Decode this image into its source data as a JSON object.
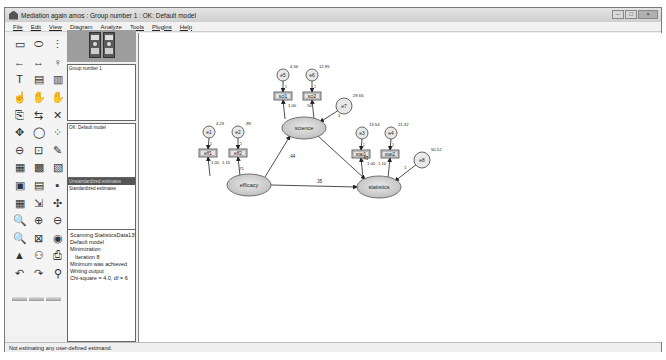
{
  "window": {
    "title": "Mediation again amos : Group number 1 : OK: Default model",
    "controls": {
      "minimize": "–",
      "maximize": "□",
      "close": "×"
    }
  },
  "menu": [
    "File",
    "Edit",
    "View",
    "Diagram",
    "Analyze",
    "Tools",
    "Plugins",
    "Help"
  ],
  "toolbox": {
    "tools": [
      {
        "name": "draw-observed-variable-icon",
        "glyph": "▭"
      },
      {
        "name": "draw-unobserved-variable-icon",
        "glyph": "⬭"
      },
      {
        "name": "draw-indicator-icon",
        "glyph": "⋮"
      },
      {
        "name": "draw-path-icon",
        "glyph": "←"
      },
      {
        "name": "draw-covariance-icon",
        "glyph": "↔"
      },
      {
        "name": "add-unique-variable-icon",
        "glyph": "♀"
      },
      {
        "name": "figure-caption-icon",
        "glyph": "T"
      },
      {
        "name": "list-variables-model-icon",
        "glyph": "▤"
      },
      {
        "name": "list-variables-dataset-icon",
        "glyph": "▥"
      },
      {
        "name": "select-one-icon",
        "glyph": "☝"
      },
      {
        "name": "select-all-icon",
        "glyph": "✋"
      },
      {
        "name": "deselect-all-icon",
        "glyph": "✋"
      },
      {
        "name": "copy-object-icon",
        "glyph": "⎘"
      },
      {
        "name": "move-object-icon",
        "glyph": "⇆"
      },
      {
        "name": "erase-object-icon",
        "glyph": "✕"
      },
      {
        "name": "change-shape-icon",
        "glyph": "✥"
      },
      {
        "name": "rotate-indicators-icon",
        "glyph": "◯"
      },
      {
        "name": "reflect-indicators-icon",
        "glyph": "⁘"
      },
      {
        "name": "move-parameter-icon",
        "glyph": "⊖"
      },
      {
        "name": "scroll-diagram-icon",
        "glyph": "⊡"
      },
      {
        "name": "touch-up-icon",
        "glyph": "✎"
      },
      {
        "name": "data-files-icon",
        "glyph": "▦"
      },
      {
        "name": "analysis-properties-icon",
        "glyph": "▩"
      },
      {
        "name": "calculate-estimates-icon",
        "glyph": "▧"
      },
      {
        "name": "copy-to-clipboard-icon",
        "glyph": "▣"
      },
      {
        "name": "view-text-icon",
        "glyph": "▤"
      },
      {
        "name": "save-diagram-icon",
        "glyph": "▪"
      },
      {
        "name": "object-properties-icon",
        "glyph": "▦"
      },
      {
        "name": "drag-properties-icon",
        "glyph": "⇲"
      },
      {
        "name": "preserve-symmetries-icon",
        "glyph": "✣"
      },
      {
        "name": "zoom-in-area-icon",
        "glyph": "🔍"
      },
      {
        "name": "zoom-in-icon",
        "glyph": "⊕"
      },
      {
        "name": "zoom-out-icon",
        "glyph": "⊖"
      },
      {
        "name": "zoom-page-icon",
        "glyph": "🔍"
      },
      {
        "name": "fit-to-page-icon",
        "glyph": "⊠"
      },
      {
        "name": "loupe-icon",
        "glyph": "◉"
      },
      {
        "name": "bayesian-icon",
        "glyph": "▲"
      },
      {
        "name": "multiple-group-icon",
        "glyph": "⚇"
      },
      {
        "name": "print-icon",
        "glyph": "⎙"
      },
      {
        "name": "undo-icon",
        "glyph": "↶"
      },
      {
        "name": "redo-icon",
        "glyph": "↷"
      },
      {
        "name": "specification-search-icon",
        "glyph": "⚲"
      }
    ]
  },
  "panels": {
    "groups": {
      "header": "Group number 1"
    },
    "models": {
      "header": "OK: Default model"
    },
    "estimates": {
      "items": [
        "Unstandardized estimates",
        "Standardized estimates"
      ],
      "selected": 0
    },
    "log": {
      "lines": [
        {
          "text": "Scanning StatisticsData139'",
          "indent": false
        },
        {
          "text": "Default model",
          "indent": false
        },
        {
          "text": "Minimization",
          "indent": false
        },
        {
          "text": "Iteration 8",
          "indent": true
        },
        {
          "text": "Minimum was achieved",
          "indent": false
        },
        {
          "text": "Writing output",
          "indent": false
        },
        {
          "text": "Chi-square = 4.0, df = 6",
          "indent": false
        }
      ]
    }
  },
  "diagram": {
    "latent": [
      {
        "id": "efficacy",
        "label": "efficacy",
        "cx": 110,
        "cy": 152
      },
      {
        "id": "science",
        "label": "science",
        "cx": 165,
        "cy": 95
      },
      {
        "id": "statistics",
        "label": "statistics",
        "cx": 240,
        "cy": 154
      }
    ],
    "observed": [
      {
        "id": "eff1",
        "label": "eff1",
        "x": 60,
        "y": 116
      },
      {
        "id": "eff2",
        "label": "eff2",
        "x": 90,
        "y": 116
      },
      {
        "id": "sci1",
        "label": "sci1",
        "x": 135,
        "y": 59
      },
      {
        "id": "sci2",
        "label": "sci2",
        "x": 164,
        "y": 59
      },
      {
        "id": "stat1",
        "label": "stat1",
        "x": 213,
        "y": 117
      },
      {
        "id": "stat2",
        "label": "stat2",
        "x": 242,
        "y": 117
      }
    ],
    "errors": [
      {
        "id": "e1",
        "label": "e1",
        "cx": 70,
        "cy": 99,
        "variance": "4.23"
      },
      {
        "id": "e2",
        "label": "e2",
        "cx": 99,
        "cy": 99,
        "variance": ".89"
      },
      {
        "id": "e5",
        "label": "e5",
        "cx": 144,
        "cy": 42,
        "variance": "4.56"
      },
      {
        "id": "e6",
        "label": "e6",
        "cx": 173,
        "cy": 42,
        "variance": "12.95"
      },
      {
        "id": "e7",
        "label": "e7",
        "cx": 205,
        "cy": 73,
        "variance": "29.66"
      },
      {
        "id": "e3",
        "label": "e3",
        "cx": 223,
        "cy": 100,
        "variance": "13.54"
      },
      {
        "id": "e4",
        "label": "e4",
        "cx": 252,
        "cy": 100,
        "variance": "21.32"
      },
      {
        "id": "e8",
        "label": "e8",
        "cx": 283,
        "cy": 127,
        "variance": "50.12"
      }
    ],
    "paths": {
      "efficacy_science": ".44",
      "science_statistics": ".43",
      "efficacy_statistics": ".35",
      "e7_science": "1",
      "e8_statistics": "1",
      "efficacy_eff1": "1.00",
      "efficacy_eff2": "1.15",
      "eff2_extra": ".71",
      "science_sci1": "1.00",
      "science_sci2": ".54",
      "statistics_stat1": "1.00",
      "statistics_stat2": "1.10",
      "error_weight": "1"
    }
  },
  "status": {
    "text": "Not estimating any user-defined estimand."
  }
}
